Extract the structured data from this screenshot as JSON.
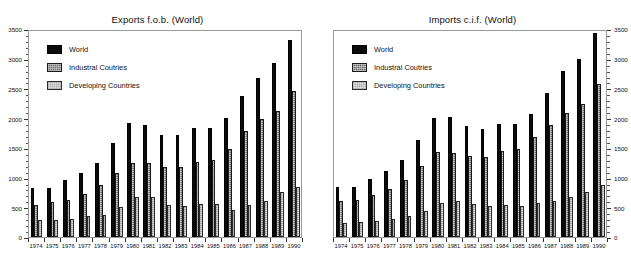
{
  "chart_data": [
    {
      "type": "bar",
      "title": "Exports f.o.b. (World)",
      "subtitle": "(In billions of U.S. Dollars)",
      "xlabel": "",
      "ylabel": "",
      "ylim": [
        0,
        3500
      ],
      "ytick_step": 500,
      "ytick_labels": [
        "0",
        "500",
        "1000",
        "1500",
        "2000",
        "2500",
        "3000",
        "3500"
      ],
      "axis_side": "left",
      "grid": false,
      "legend_position": "top-left",
      "categories": [
        "1974",
        "1975",
        "1976",
        "1977",
        "1978",
        "1979",
        "1980",
        "1981",
        "1982",
        "1983",
        "1984",
        "1985",
        "1986",
        "1987",
        "1988",
        "1989",
        "1990"
      ],
      "series": [
        {
          "name": "World",
          "values": [
            820,
            820,
            960,
            1070,
            1250,
            1590,
            1920,
            1890,
            1720,
            1720,
            1830,
            1830,
            2000,
            2370,
            2680,
            2920,
            3310
          ]
        },
        {
          "name": "Industral Coutries",
          "values": [
            535,
            585,
            615,
            720,
            880,
            1085,
            1245,
            1240,
            1180,
            1180,
            1260,
            1300,
            1480,
            1790,
            1990,
            2120,
            2450
          ]
        },
        {
          "name": "Developing Countries",
          "values": [
            285,
            280,
            305,
            350,
            375,
            510,
            665,
            670,
            545,
            520,
            555,
            550,
            455,
            540,
            610,
            760,
            840
          ]
        }
      ]
    },
    {
      "type": "bar",
      "title": "Imports c.i.f. (World)",
      "subtitle": "(In billions of U.S. Dollars)",
      "xlabel": "",
      "ylabel": "",
      "ylim": [
        0,
        3500
      ],
      "ytick_step": 500,
      "ytick_labels": [
        "0",
        "500",
        "1000",
        "1500",
        "2000",
        "2500",
        "3000",
        "3500"
      ],
      "axis_side": "right",
      "grid": false,
      "legend_position": "top-left",
      "categories": [
        "1974",
        "1975",
        "1976",
        "1977",
        "1978",
        "1979",
        "1980",
        "1981",
        "1982",
        "1983",
        "1984",
        "1985",
        "1986",
        "1987",
        "1988",
        "1989",
        "1990"
      ],
      "series": [
        {
          "name": "World",
          "values": [
            840,
            850,
            980,
            1110,
            1300,
            1630,
            2000,
            2020,
            1870,
            1810,
            1910,
            1910,
            2070,
            2430,
            2790,
            2990,
            3430
          ]
        },
        {
          "name": "Industral Coutries",
          "values": [
            600,
            620,
            700,
            800,
            960,
            1200,
            1430,
            1420,
            1360,
            1350,
            1450,
            1480,
            1680,
            1880,
            2080,
            2230,
            2570
          ]
        },
        {
          "name": "Developing Countries",
          "values": [
            230,
            260,
            265,
            310,
            350,
            430,
            570,
            600,
            560,
            520,
            540,
            530,
            570,
            600,
            680,
            750,
            870
          ]
        }
      ]
    }
  ],
  "panels": [
    {
      "key": "exports",
      "title": "Exports f.o.b. (World)",
      "subtitle": "(In billions of U.S. Dollars)",
      "legend": [
        {
          "label": "World",
          "swatch": "solid-black-swatch"
        },
        {
          "label": "Industral Coutries",
          "swatch": "dark-hatch-swatch"
        },
        {
          "label": "Developing Countries",
          "swatch": "light-hatch-swatch"
        }
      ]
    },
    {
      "key": "imports",
      "title": "Imports c.i.f. (World)",
      "subtitle": "(In billions of U.S. Dollars)",
      "legend": [
        {
          "label": "World",
          "swatch": "solid-black-swatch"
        },
        {
          "label": "Industral Coutries",
          "swatch": "dark-hatch-swatch"
        },
        {
          "label": "Developing Countries",
          "swatch": "light-hatch-swatch"
        }
      ]
    }
  ],
  "colors": {
    "world": "#0b0b0b",
    "industrial": "#6e6e6e",
    "developing": "#dedede",
    "frame": "#9a9a9a",
    "text": "#111111",
    "background": "#ffffff"
  }
}
